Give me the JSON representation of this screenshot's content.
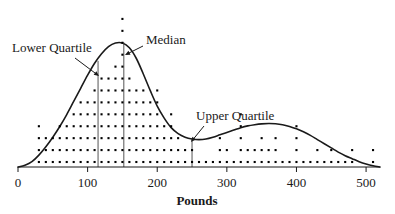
{
  "chart_data": {
    "type": "scatter",
    "title": "",
    "subtitle": "",
    "xlabel": "Pounds",
    "ylabel": "",
    "xlim": [
      0,
      520
    ],
    "ylim": [
      0,
      13
    ],
    "grid": false,
    "legend": null,
    "xticks": [
      0,
      100,
      200,
      300,
      400,
      500
    ],
    "xtick_labels": [
      "0",
      "100",
      "200",
      "300",
      "400",
      "500"
    ],
    "dot_stack_bin_width": 10,
    "dot_stacks": [
      {
        "x": 30,
        "count": 4
      },
      {
        "x": 40,
        "count": 3
      },
      {
        "x": 50,
        "count": 3
      },
      {
        "x": 60,
        "count": 4
      },
      {
        "x": 70,
        "count": 4
      },
      {
        "x": 80,
        "count": 5
      },
      {
        "x": 90,
        "count": 6
      },
      {
        "x": 100,
        "count": 6
      },
      {
        "x": 110,
        "count": 7
      },
      {
        "x": 120,
        "count": 8
      },
      {
        "x": 130,
        "count": 8
      },
      {
        "x": 140,
        "count": 9
      },
      {
        "x": 150,
        "count": 13
      },
      {
        "x": 160,
        "count": 8
      },
      {
        "x": 170,
        "count": 7
      },
      {
        "x": 180,
        "count": 7
      },
      {
        "x": 190,
        "count": 6
      },
      {
        "x": 200,
        "count": 7
      },
      {
        "x": 210,
        "count": 4
      },
      {
        "x": 220,
        "count": 5
      },
      {
        "x": 230,
        "count": 3
      },
      {
        "x": 240,
        "count": 2
      },
      {
        "x": 250,
        "count": 2
      },
      {
        "x": 260,
        "count": 1
      },
      {
        "x": 270,
        "count": 1
      },
      {
        "x": 280,
        "count": 1
      },
      {
        "x": 290,
        "count": 3
      },
      {
        "x": 300,
        "count": 2
      },
      {
        "x": 310,
        "count": 1
      },
      {
        "x": 320,
        "count": 5
      },
      {
        "x": 330,
        "count": 2
      },
      {
        "x": 340,
        "count": 2
      },
      {
        "x": 350,
        "count": 3
      },
      {
        "x": 360,
        "count": 2
      },
      {
        "x": 370,
        "count": 3
      },
      {
        "x": 380,
        "count": 1
      },
      {
        "x": 390,
        "count": 1
      },
      {
        "x": 400,
        "count": 4
      },
      {
        "x": 410,
        "count": 1
      },
      {
        "x": 420,
        "count": 1
      },
      {
        "x": 430,
        "count": 2
      },
      {
        "x": 440,
        "count": 1
      },
      {
        "x": 450,
        "count": 2
      },
      {
        "x": 460,
        "count": 1
      },
      {
        "x": 470,
        "count": 1
      },
      {
        "x": 480,
        "count": 2
      },
      {
        "x": 510,
        "count": 2
      }
    ],
    "density_curve": [
      {
        "x": 0,
        "y": 0.0
      },
      {
        "x": 10,
        "y": 0.15
      },
      {
        "x": 20,
        "y": 0.45
      },
      {
        "x": 30,
        "y": 1.0
      },
      {
        "x": 40,
        "y": 1.7
      },
      {
        "x": 50,
        "y": 2.5
      },
      {
        "x": 60,
        "y": 3.4
      },
      {
        "x": 70,
        "y": 4.4
      },
      {
        "x": 80,
        "y": 5.5
      },
      {
        "x": 90,
        "y": 6.6
      },
      {
        "x": 100,
        "y": 7.7
      },
      {
        "x": 110,
        "y": 8.7
      },
      {
        "x": 120,
        "y": 9.5
      },
      {
        "x": 130,
        "y": 10.1
      },
      {
        "x": 140,
        "y": 10.4
      },
      {
        "x": 150,
        "y": 10.4
      },
      {
        "x": 160,
        "y": 10.0
      },
      {
        "x": 170,
        "y": 9.1
      },
      {
        "x": 180,
        "y": 7.8
      },
      {
        "x": 190,
        "y": 6.4
      },
      {
        "x": 200,
        "y": 5.1
      },
      {
        "x": 210,
        "y": 4.1
      },
      {
        "x": 220,
        "y": 3.3
      },
      {
        "x": 230,
        "y": 2.8
      },
      {
        "x": 240,
        "y": 2.5
      },
      {
        "x": 250,
        "y": 2.35
      },
      {
        "x": 260,
        "y": 2.3
      },
      {
        "x": 270,
        "y": 2.35
      },
      {
        "x": 280,
        "y": 2.5
      },
      {
        "x": 290,
        "y": 2.7
      },
      {
        "x": 300,
        "y": 2.9
      },
      {
        "x": 310,
        "y": 3.1
      },
      {
        "x": 320,
        "y": 3.3
      },
      {
        "x": 330,
        "y": 3.45
      },
      {
        "x": 340,
        "y": 3.55
      },
      {
        "x": 350,
        "y": 3.62
      },
      {
        "x": 360,
        "y": 3.65
      },
      {
        "x": 370,
        "y": 3.63
      },
      {
        "x": 380,
        "y": 3.55
      },
      {
        "x": 390,
        "y": 3.4
      },
      {
        "x": 400,
        "y": 3.2
      },
      {
        "x": 410,
        "y": 2.95
      },
      {
        "x": 420,
        "y": 2.65
      },
      {
        "x": 430,
        "y": 2.3
      },
      {
        "x": 440,
        "y": 1.95
      },
      {
        "x": 450,
        "y": 1.6
      },
      {
        "x": 460,
        "y": 1.25
      },
      {
        "x": 470,
        "y": 0.95
      },
      {
        "x": 480,
        "y": 0.7
      },
      {
        "x": 490,
        "y": 0.45
      },
      {
        "x": 500,
        "y": 0.25
      },
      {
        "x": 510,
        "y": 0.1
      },
      {
        "x": 520,
        "y": 0.0
      }
    ],
    "reference_lines": [
      {
        "name": "lower-quartile",
        "x": 115,
        "y_top": 8.9,
        "label": "Lower Quartile"
      },
      {
        "name": "median",
        "x": 152,
        "y_top": 10.45,
        "label": "Median"
      },
      {
        "name": "upper-quartile",
        "x": 250,
        "y_top": 2.35,
        "label": "Upper Quartile"
      }
    ],
    "annotations": [
      {
        "name": "lower-quartile-annotation",
        "text": "Lower Quartile",
        "text_x": 12,
        "text_y": 52,
        "arrow_from_x": 75,
        "arrow_from_y": 58,
        "arrow_to_x": 99,
        "arrow_to_y": 76
      },
      {
        "name": "median-annotation",
        "text": "Median",
        "text_x": 146,
        "text_y": 44,
        "arrow_from_x": 143,
        "arrow_from_y": 46,
        "arrow_to_x": 125,
        "arrow_to_y": 55
      },
      {
        "name": "upper-quartile-annotation",
        "text": "Upper Quartile",
        "text_x": 196,
        "text_y": 120,
        "arrow_from_x": 204,
        "arrow_from_y": 126,
        "arrow_to_x": 191,
        "arrow_to_y": 142
      }
    ],
    "colors": {
      "ink": "#1a1a1a",
      "curve": "#1a1a1a",
      "dot": "#000000",
      "reference_line": "#555555",
      "background": "#ffffff"
    }
  }
}
